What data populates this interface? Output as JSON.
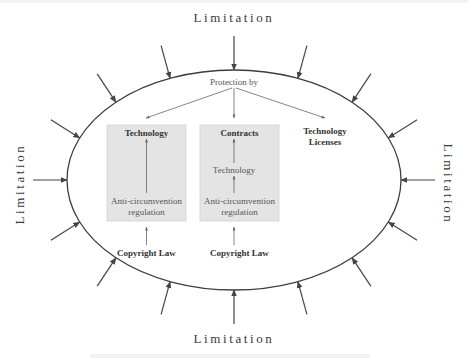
{
  "diagram": {
    "limitation_labels": {
      "top": "Limitation",
      "bottom": "Limitation",
      "left": "Limitation",
      "right": "Limitation"
    },
    "protection_label": "Protection by",
    "columns": [
      {
        "id": "technology",
        "title": "Technology",
        "boxed": true,
        "inner_chain": [
          "Anti-circumvention regulation"
        ],
        "inner_lines": [
          "Anti-circumvention",
          "regulation"
        ],
        "source": "Copyright Law"
      },
      {
        "id": "contracts",
        "title": "Contracts",
        "boxed": true,
        "inner_chain": [
          "Technology",
          "Anti-circumvention regulation"
        ],
        "middle": "Technology",
        "inner_lines": [
          "Anti-circumvention",
          "regulation"
        ],
        "source": "Copyright Law"
      },
      {
        "id": "technology-licenses",
        "title_lines": [
          "Technology",
          "Licenses"
        ],
        "boxed": false
      }
    ],
    "limitation_arrow_count": 16,
    "colors": {
      "ellipse": "#3d3d3d",
      "box_fill": "#e4e4e4",
      "text_main": "#333333",
      "text_light": "#555555"
    }
  }
}
